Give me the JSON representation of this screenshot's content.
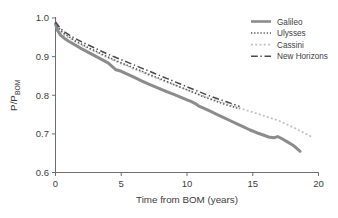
{
  "chart_data": {
    "type": "line",
    "title": "",
    "xlabel": "Time from BOM (years)",
    "ylabel": "P/P",
    "ylabel_sub": "BOM",
    "xlim": [
      0,
      20
    ],
    "ylim": [
      0.6,
      1.0
    ],
    "xticks": [
      0,
      5,
      10,
      15,
      20
    ],
    "xtick_labels": [
      "0",
      "5",
      "10",
      "15",
      "20"
    ],
    "yticks": [
      0.6,
      0.7,
      0.8,
      0.9,
      1.0
    ],
    "ytick_labels": [
      "0.6",
      "0.7",
      "0.8",
      "0.9",
      "1.0"
    ],
    "grid": false,
    "legend_position": "top-right",
    "series": [
      {
        "name": "Galileo",
        "style": "solid",
        "color": "#8c8c8c",
        "width": 3.0,
        "x": [
          0.0,
          0.15,
          0.4,
          0.7,
          1.0,
          1.5,
          2.0,
          2.5,
          3.0,
          3.5,
          4.0,
          4.3,
          4.6,
          5.0,
          5.5,
          6.0,
          6.5,
          7.0,
          7.5,
          8.0,
          8.5,
          9.0,
          9.5,
          10.0,
          10.3,
          10.6,
          10.9,
          11.3,
          11.8,
          12.3,
          12.8,
          13.3,
          13.8,
          14.3,
          14.8,
          15.3,
          15.8,
          16.2,
          16.6,
          16.9,
          17.2,
          17.6,
          18.0,
          18.3,
          18.5,
          18.6
        ],
        "y": [
          0.985,
          0.968,
          0.955,
          0.947,
          0.94,
          0.93,
          0.92,
          0.911,
          0.902,
          0.893,
          0.884,
          0.875,
          0.866,
          0.862,
          0.854,
          0.846,
          0.838,
          0.83,
          0.823,
          0.816,
          0.809,
          0.802,
          0.795,
          0.788,
          0.784,
          0.779,
          0.772,
          0.766,
          0.758,
          0.75,
          0.742,
          0.734,
          0.726,
          0.718,
          0.71,
          0.703,
          0.697,
          0.692,
          0.69,
          0.693,
          0.688,
          0.68,
          0.672,
          0.664,
          0.658,
          0.655
        ]
      },
      {
        "name": "Ulysses",
        "style": "dotted",
        "color": "#5a5a5a",
        "width": 1.6,
        "x": [
          0.0,
          0.3,
          0.6,
          1.0,
          1.5,
          2.0,
          2.5,
          3.0,
          3.5,
          4.0,
          4.5,
          5.0,
          5.5,
          6.0,
          6.5,
          7.0,
          7.5,
          8.0,
          8.5,
          9.0,
          9.5,
          10.0,
          10.5,
          11.0,
          11.5,
          12.0,
          12.5,
          13.0,
          13.5,
          14.0
        ],
        "y": [
          0.988,
          0.972,
          0.961,
          0.952,
          0.941,
          0.932,
          0.923,
          0.915,
          0.907,
          0.899,
          0.891,
          0.884,
          0.877,
          0.87,
          0.863,
          0.856,
          0.849,
          0.842,
          0.835,
          0.828,
          0.821,
          0.814,
          0.807,
          0.8,
          0.793,
          0.787,
          0.781,
          0.775,
          0.77,
          0.765
        ]
      },
      {
        "name": "Cassini",
        "style": "dotted-light",
        "color": "#c2c2c2",
        "width": 1.8,
        "x": [
          0.0,
          0.3,
          0.6,
          1.0,
          1.5,
          2.0,
          2.5,
          3.0,
          3.5,
          4.0,
          4.5,
          5.0,
          5.5,
          6.0,
          6.5,
          7.0,
          7.5,
          8.0,
          9.0,
          10.0,
          11.0,
          12.0,
          13.0,
          14.0,
          15.0,
          16.0,
          17.0,
          18.0,
          19.0,
          19.5
        ],
        "y": [
          0.983,
          0.968,
          0.957,
          0.949,
          0.939,
          0.93,
          0.921,
          0.913,
          0.905,
          0.897,
          0.889,
          0.882,
          0.875,
          0.868,
          0.861,
          0.854,
          0.847,
          0.84,
          0.827,
          0.814,
          0.801,
          0.789,
          0.778,
          0.767,
          0.756,
          0.745,
          0.734,
          0.718,
          0.701,
          0.692
        ]
      },
      {
        "name": "New Horizons",
        "style": "dashdot",
        "color": "#4a4a4a",
        "width": 1.5,
        "x": [
          0.0,
          0.3,
          0.6,
          1.0,
          1.5,
          2.0,
          2.5,
          3.0,
          3.5,
          4.0,
          4.5,
          5.0,
          5.5,
          6.0,
          6.5,
          7.0,
          7.5,
          8.0,
          8.5,
          9.0,
          9.5,
          10.0,
          10.5,
          11.0,
          11.5,
          12.0,
          12.5,
          13.0,
          13.5,
          14.0
        ],
        "y": [
          0.99,
          0.976,
          0.966,
          0.957,
          0.947,
          0.938,
          0.93,
          0.922,
          0.914,
          0.906,
          0.899,
          0.892,
          0.885,
          0.878,
          0.871,
          0.864,
          0.857,
          0.85,
          0.843,
          0.836,
          0.829,
          0.822,
          0.815,
          0.808,
          0.801,
          0.795,
          0.789,
          0.783,
          0.777,
          0.771
        ]
      }
    ],
    "legend": [
      {
        "label": "Galileo",
        "style": "solid",
        "color": "#8c8c8c"
      },
      {
        "label": "Ulysses",
        "style": "dotted",
        "color": "#5a5a5a"
      },
      {
        "label": "Cassini",
        "style": "dotted-light",
        "color": "#c2c2c2"
      },
      {
        "label": "New Horizons",
        "style": "dashdot",
        "color": "#4a4a4a"
      }
    ]
  }
}
